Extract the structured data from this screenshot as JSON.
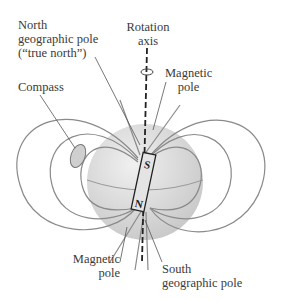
{
  "diagram": {
    "labels": {
      "north_geo_line1": "North",
      "north_geo_line2": "geographic pole",
      "north_geo_line3": "(“true north”)",
      "rotation_line1": "Rotation",
      "rotation_line2": "axis",
      "compass": "Compass",
      "mag_top_line1": "Magnetic",
      "mag_top_line2": "pole",
      "mag_bottom_line1": "Magnetic",
      "mag_bottom_line2": "pole",
      "south_geo_line1": "South",
      "south_geo_line2": "geographic pole"
    },
    "magnet": {
      "top_label": "S",
      "bottom_label": "N"
    },
    "colors": {
      "field_line": "#8a8a8a",
      "globe": "#d6d6d6",
      "text": "#3a3a3a",
      "axis": "#222222"
    }
  }
}
